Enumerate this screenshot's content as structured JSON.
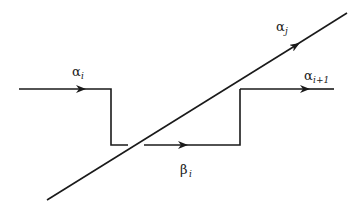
{
  "diagram": {
    "type": "path-crossing-diagram",
    "stroke_color": "#1a1a1a",
    "background": "#ffffff",
    "labels": {
      "alpha_i": {
        "symbol": "α",
        "subscript": "i"
      },
      "alpha_j": {
        "symbol": "α",
        "subscript": "j"
      },
      "alpha_i_plus_1": {
        "symbol": "α",
        "subscript": "i+1"
      },
      "beta_i": {
        "symbol": "β",
        "subscript": "i"
      }
    },
    "paths": [
      {
        "name": "alpha_i",
        "description": "horizontal path entering from left, arrow pointing right, then drops down"
      },
      {
        "name": "beta_i",
        "description": "lower horizontal path crossing under diagonal, arrow pointing right"
      },
      {
        "name": "alpha_i_plus_1",
        "description": "horizontal path continuing upper right, arrow pointing right"
      },
      {
        "name": "alpha_j",
        "description": "diagonal line from lower left to upper right, arrow pointing up-right, passes over the lower path"
      }
    ]
  }
}
